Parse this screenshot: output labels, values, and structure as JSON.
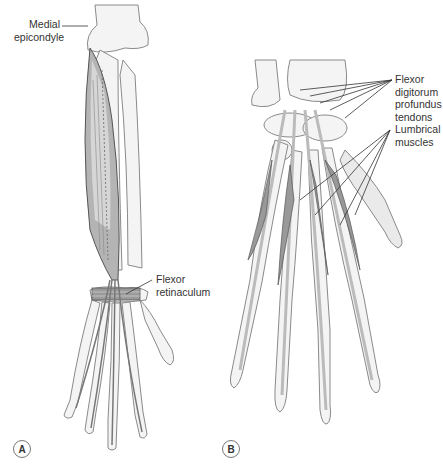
{
  "figure": {
    "panels": [
      {
        "id": "A",
        "badge": "A",
        "description": "Anterior forearm and hand showing muscle with long tendons",
        "labels": [
          {
            "key": "medial_epicondyle",
            "line1": "Medial",
            "line2": "epicondyle"
          },
          {
            "key": "flexor_retinaculum",
            "line1": "Flexor",
            "line2": "retinaculum"
          }
        ]
      },
      {
        "id": "B",
        "badge": "B",
        "description": "Palmar hand showing flexor digitorum profundus tendons and lumbrical muscles",
        "labels": [
          {
            "key": "fdp_tendons",
            "line1": "Flexor",
            "line2": "digitorum",
            "line3": "profundus",
            "line4": "tendons"
          },
          {
            "key": "lumbricals",
            "line1": "Lumbrical",
            "line2": "muscles"
          }
        ]
      }
    ]
  },
  "colors": {
    "bone_fill": "#f4f4f4",
    "bone_stroke": "#8a8a8a",
    "muscle_fill": "#a9a9a9",
    "muscle_light": "#cfcfcf",
    "tendon": "#b9b9b9",
    "leader": "#333333",
    "text": "#333333"
  }
}
